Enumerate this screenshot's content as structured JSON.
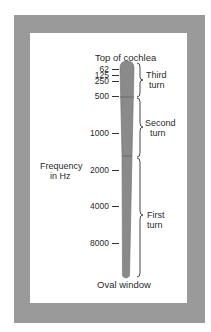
{
  "title": "Top of cochlea",
  "bottom_label": "Oval window",
  "axis_label": {
    "line1": "Frequency",
    "line2": "in Hz"
  },
  "ticks": [
    {
      "label": "62",
      "y": 69
    },
    {
      "label": "125",
      "y": 75
    },
    {
      "label": "250",
      "y": 81
    },
    {
      "label": "500",
      "y": 96
    },
    {
      "label": "1000",
      "y": 133
    },
    {
      "label": "2000",
      "y": 170
    },
    {
      "label": "4000",
      "y": 206
    },
    {
      "label": "8000",
      "y": 243
    }
  ],
  "turns": [
    {
      "line1": "Third",
      "line2": "turn"
    },
    {
      "line1": "Second",
      "line2": "turn"
    },
    {
      "line1": "First",
      "line2": "turn"
    }
  ],
  "colors": {
    "frame": "#9a9a9a",
    "bar": "#8a8a8a",
    "background": "#ffffff"
  }
}
